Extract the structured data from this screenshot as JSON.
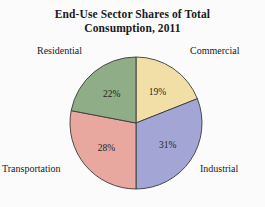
{
  "chart_data": {
    "type": "pie",
    "title": "End-Use Sector Shares of Total Consumption, 2011",
    "title_lines": [
      "End-Use Sector Shares of Total",
      "Consumption, 2011"
    ],
    "xlabel": "",
    "ylabel": "",
    "units": "percent",
    "total": 100,
    "start_angle_deg": 0,
    "direction": "clockwise",
    "legend": "none",
    "grid": false,
    "categories": [
      "Commercial",
      "Industrial",
      "Transportation",
      "Residential"
    ],
    "values": [
      19,
      31,
      28,
      22
    ],
    "slices": [
      {
        "label": "Commercial",
        "value": 19,
        "value_text": "19%",
        "color": "#f2dfa8",
        "label_position": "upper-right"
      },
      {
        "label": "Industrial",
        "value": 31,
        "value_text": "31%",
        "color": "#a3a6d4",
        "label_position": "lower-right"
      },
      {
        "label": "Transportation",
        "value": 28,
        "value_text": "28%",
        "color": "#e8a8a0",
        "label_position": "lower-left"
      },
      {
        "label": "Residential",
        "value": 22,
        "value_text": "22%",
        "color": "#8fad86",
        "label_position": "upper-left"
      }
    ]
  },
  "style": {
    "background": "#fbfbfb",
    "outline": "#3a3a3a",
    "text": "#1a1a1a"
  }
}
